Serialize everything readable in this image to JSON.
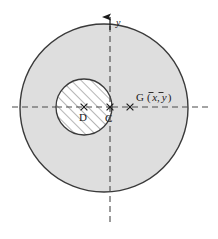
{
  "figure": {
    "background_color": "#ffffff",
    "width": 218,
    "height": 239
  },
  "colors": {
    "outer_fill": "#dedede",
    "outer_stroke": "#3a3a3a",
    "inner_fill": "#ffffff",
    "inner_stroke": "#3a3a3a",
    "hatch_stroke": "#6e6e6e",
    "axis_stroke": "#4a4a4a",
    "label_color": "#1a1a1a",
    "marker_color": "#1a1a1a"
  },
  "axes": {
    "vertical": {
      "label": "y",
      "x": 110,
      "y_top": 16,
      "y_bottom": 222,
      "has_arrowhead": true,
      "style": "dashed"
    },
    "horizontal": {
      "label": "",
      "y": 107,
      "x_left": 12,
      "x_right": 210,
      "has_arrowhead": false,
      "style": "dashed"
    }
  },
  "shapes": {
    "outer_circle": {
      "name": "outer-circle",
      "cx": 104,
      "cy": 108,
      "r": 84,
      "fill": "#dedede"
    },
    "inner_circle": {
      "name": "inner-circle-hatched",
      "cx": 84,
      "cy": 107,
      "r": 28,
      "fill": "#ffffff",
      "hatch_angle_deg": 45
    }
  },
  "points": [
    {
      "id": "D",
      "label": "D",
      "x": 84,
      "y": 107,
      "marker": "cross",
      "label_dx": -4,
      "label_dy": 13,
      "description": "center of hatched hole"
    },
    {
      "id": "C",
      "label": "C",
      "x": 110,
      "y": 107,
      "marker": "cross",
      "label_dx": -4,
      "label_dy": 14,
      "description": "origin at axes intersection"
    },
    {
      "id": "G",
      "label": "G",
      "x": 130,
      "y": 107,
      "marker": "cross",
      "label_dx": 6,
      "label_dy": -6,
      "description": "centroid of remaining area"
    }
  ],
  "labels": {
    "centroid": {
      "symbol": "G",
      "open_paren": "(",
      "x_bar": "x",
      "comma": ",",
      "y_bar": "y",
      "close_paren": ")",
      "full_text": "G (x̄, ȳ)"
    },
    "axis_y": "y",
    "point_c": "C",
    "point_d": "D"
  }
}
